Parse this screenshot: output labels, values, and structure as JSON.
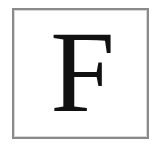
{
  "card": {
    "letter": "F",
    "border_color": "#8a8a8a",
    "text_color": "#111111",
    "background": "#ffffff"
  }
}
